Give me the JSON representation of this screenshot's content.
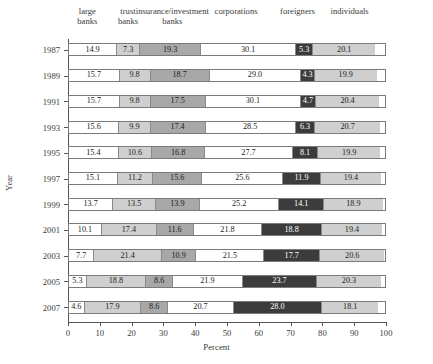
{
  "chart_data": {
    "type": "bar",
    "orientation": "horizontal",
    "stacked": true,
    "title": "",
    "xlabel": "Percent",
    "ylabel": "Year",
    "xlim": [
      0,
      100
    ],
    "xticks": [
      0,
      10,
      20,
      30,
      40,
      50,
      60,
      70,
      80,
      90,
      100
    ],
    "grid": false,
    "legend_position": "top",
    "categories": [
      "1987",
      "1989",
      "1991",
      "1993",
      "1995",
      "1997",
      "1999",
      "2001",
      "2003",
      "2005",
      "2007"
    ],
    "series": [
      {
        "name": "large banks",
        "label_line1": "large",
        "label_line2": "banks",
        "color": "#ffffff",
        "values": [
          14.9,
          15.7,
          15.7,
          15.6,
          15.4,
          15.1,
          13.7,
          10.1,
          7.7,
          5.3,
          4.6
        ]
      },
      {
        "name": "trust banks",
        "label_line1": "trust",
        "label_line2": "banks",
        "color": "#cfcfcf",
        "values": [
          7.3,
          9.8,
          9.8,
          9.9,
          10.6,
          11.2,
          13.5,
          17.4,
          21.4,
          18.8,
          17.9
        ]
      },
      {
        "name": "insurance/investment banks",
        "label_line1": "insurance/investment",
        "label_line2": "banks",
        "color": "#a8a8a8",
        "values": [
          19.3,
          18.7,
          17.5,
          17.4,
          16.8,
          15.6,
          13.9,
          11.6,
          10.9,
          8.6,
          8.6
        ]
      },
      {
        "name": "corporations",
        "label_line1": "corporations",
        "label_line2": "",
        "color": "#ffffff",
        "values": [
          30.1,
          29.0,
          30.1,
          28.5,
          27.7,
          25.6,
          25.2,
          21.8,
          21.5,
          21.9,
          20.7
        ]
      },
      {
        "name": "foreigners",
        "label_line1": "foreigners",
        "label_line2": "",
        "color": "#3c3c3c",
        "values": [
          5.3,
          4.3,
          4.7,
          6.3,
          8.1,
          11.9,
          14.1,
          18.8,
          17.7,
          23.7,
          28.0
        ]
      },
      {
        "name": "individuals",
        "label_line1": "individuals",
        "label_line2": "",
        "color": "#cfcfcf",
        "values": [
          20.1,
          19.9,
          20.4,
          20.7,
          19.9,
          19.4,
          18.9,
          19.4,
          20.6,
          20.3,
          18.1
        ]
      }
    ]
  }
}
